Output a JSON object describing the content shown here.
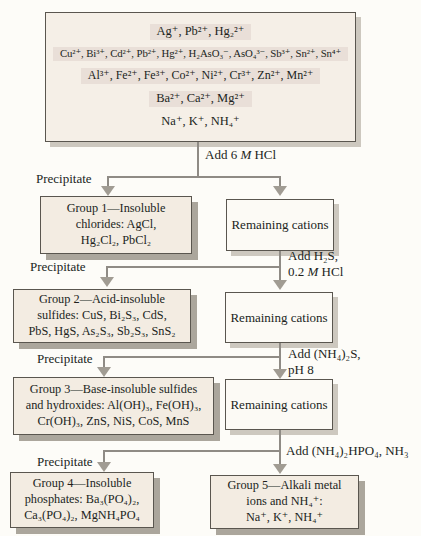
{
  "figure": {
    "type": "flowchart"
  },
  "colors": {
    "paper": "#fdfcf8",
    "box_fill": "#f4eee5",
    "row_highlight": "#e9dfd8",
    "remaining_fill": "#fcfaf5",
    "group_shadow": "#aba69c",
    "light_shadow": "#cdc8bf",
    "border": "#5a564f",
    "connector": "#8f8b85",
    "text": "#211f1c"
  },
  "mixture": {
    "rows": [
      {
        "text": "Ag⁺, Pb²⁺, Hg₂²⁺",
        "highlight": true
      },
      {
        "text": "Cu²⁺, Bi³⁺, Cd²⁺, Pb²⁺, Hg²⁺, H₂AsO₃⁻, AsO₄³⁻, Sb³⁺, Sn²⁺, Sn⁴⁺",
        "highlight": true
      },
      {
        "text": "Al³⁺, Fe²⁺, Fe³⁺, Co²⁺, Ni²⁺, Cr³⁺, Zn²⁺, Mn²⁺",
        "highlight": true
      },
      {
        "text": "Ba²⁺, Ca²⁺, Mg²⁺",
        "highlight": true
      },
      {
        "text": "Na⁺, K⁺, NH₄⁺",
        "highlight": false
      }
    ]
  },
  "labels": {
    "remaining_cations": "Remaining cations"
  },
  "stages": [
    {
      "precipitate": "Precipitate",
      "reagent": {
        "l1_pre": "Add 6 ",
        "l1_m": "M",
        "l1_post": " HCl"
      }
    },
    {
      "precipitate": "Precipitate",
      "reagent": {
        "l1": "Add H₂S,",
        "l2_pre": "0.2 ",
        "l2_m": "M",
        "l2_post": " HCl"
      }
    },
    {
      "precipitate": "Precipitate",
      "reagent": {
        "l1": "Add (NH₄)₂S,",
        "l2": "pH 8"
      }
    },
    {
      "precipitate": "Precipitate",
      "reagent": {
        "l1": "Add (NH₄)₂HPO₄, NH₃"
      }
    }
  ],
  "groups": [
    {
      "lines": [
        "Group 1—Insoluble",
        "chlorides: AgCl,",
        "Hg₂Cl₂, PbCl₂"
      ]
    },
    {
      "lines": [
        "Group 2—Acid-insoluble",
        "sulfides: CuS, Bi₂S₃, CdS,",
        "PbS, HgS, As₂S₃, Sb₂S₃, SnS₂"
      ]
    },
    {
      "lines": [
        "Group 3—Base-insoluble sulfides",
        "and hydroxides: Al(OH)₃, Fe(OH)₃,",
        "Cr(OH)₃, ZnS, NiS, CoS, MnS"
      ]
    },
    {
      "lines": [
        "Group 4—Insoluble",
        "phosphates: Ba₃(PO₄)₂,",
        "Ca₃(PO₄)₂, MgNH₄PO₄"
      ]
    },
    {
      "lines": [
        "Group 5—Alkali metal",
        "ions and NH₄⁺:",
        "Na⁺, K⁺, NH₄⁺"
      ]
    }
  ]
}
